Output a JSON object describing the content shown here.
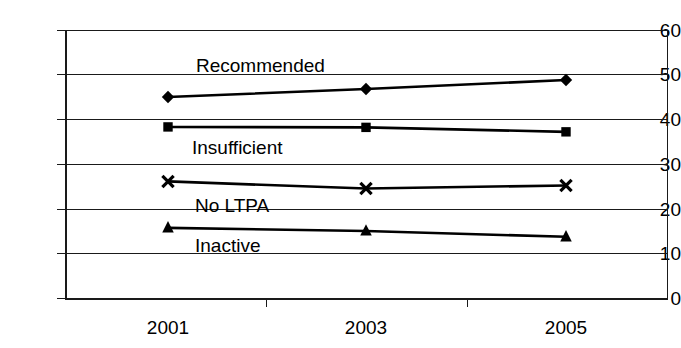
{
  "chart_data": {
    "type": "line",
    "title": "",
    "xlabel": "",
    "ylabel": "",
    "categories": [
      "2001",
      "2003",
      "2005"
    ],
    "x": [
      2001,
      2003,
      2005
    ],
    "ylim": [
      0,
      60
    ],
    "yticks": [
      0,
      10,
      20,
      30,
      40,
      50,
      60
    ],
    "ytick_labels": [
      "0",
      "10",
      "20",
      "30",
      "40",
      "50",
      "60"
    ],
    "grid": "horizontal",
    "legend_position": "inline-labels",
    "series": [
      {
        "name": "Recommended",
        "marker": "diamond",
        "values": [
          45.0,
          46.8,
          48.8
        ]
      },
      {
        "name": "Insufficient",
        "marker": "square",
        "values": [
          38.3,
          38.2,
          37.2
        ]
      },
      {
        "name": "No LTPA",
        "marker": "x",
        "values": [
          26.1,
          24.5,
          25.2
        ]
      },
      {
        "name": "Inactive",
        "marker": "triangle",
        "values": [
          15.7,
          15.0,
          13.7
        ]
      }
    ],
    "annotations": [
      {
        "text": "Recommended",
        "x": 196,
        "y": 56
      },
      {
        "text": "Insufficient",
        "x": 192,
        "y": 138
      },
      {
        "text": "No LTPA",
        "x": 195,
        "y": 196
      },
      {
        "text": "Inactive",
        "x": 195,
        "y": 236
      }
    ],
    "colors": {
      "line": "#000000",
      "marker": "#000000",
      "grid": "#1a1a1a",
      "axis": "#000000",
      "background": "#ffffff",
      "text": "#000000"
    }
  },
  "axes": {
    "y_labels": [
      "60",
      "50",
      "40",
      "30",
      "20",
      "10",
      "0"
    ],
    "x_labels": [
      "2001",
      "2003",
      "2005"
    ]
  }
}
